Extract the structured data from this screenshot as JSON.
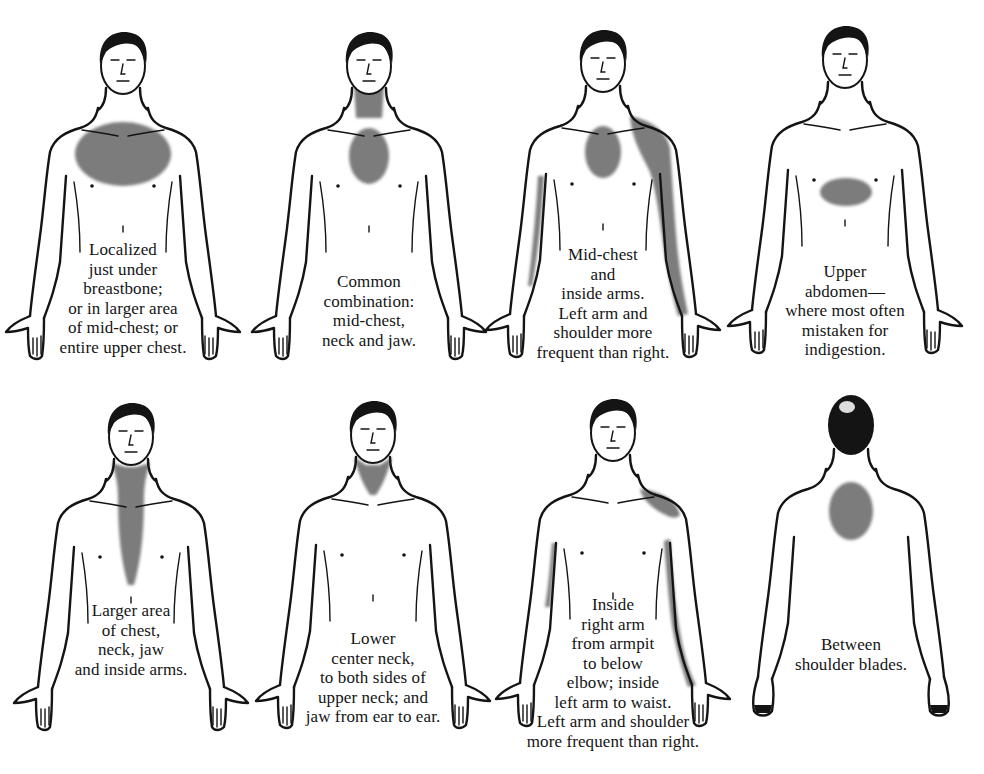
{
  "diagram": {
    "title": "",
    "layout": {
      "rows": 2,
      "columns": 4
    },
    "colors": {
      "pain_shading": "#7b7b7b",
      "line_art": "#141414",
      "background": "#ffffff"
    },
    "panels": [
      {
        "id": "localized-chest",
        "view": "front",
        "pain_regions": [
          "upper chest (large oval)"
        ],
        "caption": [
          "Localized",
          "just under",
          "breastbone;",
          "or in larger area",
          "of mid-chest; or",
          "entire upper chest."
        ]
      },
      {
        "id": "mid-chest-neck-jaw",
        "view": "front",
        "pain_regions": [
          "mid-chest",
          "neck",
          "jaw"
        ],
        "caption": [
          "Common",
          "combination:",
          "mid-chest,",
          "neck and jaw."
        ]
      },
      {
        "id": "mid-chest-inside-arms",
        "view": "front",
        "pain_regions": [
          "mid-chest",
          "left shoulder",
          "inside left arm",
          "inside right arm"
        ],
        "caption": [
          "Mid-chest",
          "and",
          "inside arms.",
          "Left arm and",
          "shoulder more",
          "frequent than right."
        ]
      },
      {
        "id": "upper-abdomen",
        "view": "front",
        "pain_regions": [
          "upper abdomen"
        ],
        "caption": [
          "Upper",
          "abdomen—",
          "where most often",
          "mistaken for",
          "indigestion."
        ]
      },
      {
        "id": "chest-neck-jaw-arms",
        "view": "front",
        "pain_regions": [
          "jaw",
          "neck",
          "center chest (tapering)"
        ],
        "caption": [
          "Larger area",
          "of chest,",
          "neck, jaw",
          "and inside arms."
        ]
      },
      {
        "id": "lower-neck-jaw",
        "view": "front",
        "pain_regions": [
          "lower center neck",
          "sides of upper neck",
          "jaw"
        ],
        "caption": [
          "Lower",
          "center neck,",
          "to both sides of",
          "upper neck; and",
          "jaw from ear to ear."
        ]
      },
      {
        "id": "inside-arms",
        "view": "front",
        "pain_regions": [
          "left shoulder",
          "inside left arm to waist",
          "inside right arm to below elbow"
        ],
        "caption": [
          "Inside",
          "right arm",
          "from armpit",
          "to below",
          "elbow; inside",
          "left arm to waist.",
          "Left arm and shoulder",
          "more frequent than right."
        ]
      },
      {
        "id": "between-shoulder-blades",
        "view": "back",
        "pain_regions": [
          "between shoulder blades"
        ],
        "caption": [
          "Between",
          "shoulder blades."
        ]
      }
    ]
  }
}
